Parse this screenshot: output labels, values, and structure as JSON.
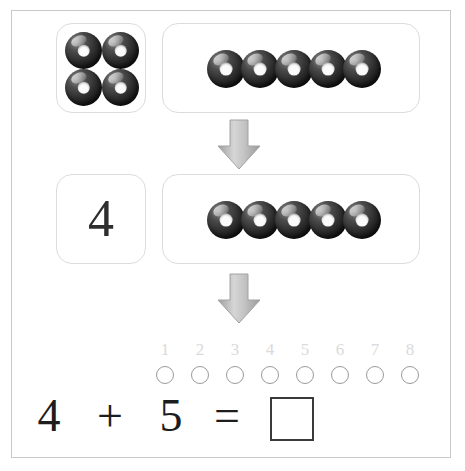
{
  "worksheet": {
    "title": "Addition with beads: 4 + 5",
    "background_color": "#ffffff",
    "frame_border_color": "#c9c9c9"
  },
  "row1": {
    "left_group": {
      "label": "four-beads-group",
      "bead_count": 4,
      "arrangement": "2x2"
    },
    "right_group": {
      "label": "five-beads-group",
      "bead_count": 5,
      "arrangement": "row"
    }
  },
  "arrow1": {
    "direction": "down",
    "color": "#b0b0b0"
  },
  "row2": {
    "left_group": {
      "label": "numeral-card",
      "value": "4"
    },
    "right_group": {
      "label": "five-beads-group",
      "bead_count": 5,
      "arrangement": "row"
    }
  },
  "arrow2": {
    "direction": "down",
    "color": "#b0b0b0"
  },
  "counting_strip": {
    "labels": [
      "1",
      "2",
      "3",
      "4",
      "5",
      "6",
      "7",
      "8"
    ],
    "circle_count": 8,
    "label_color": "#dadada",
    "circle_border_color": "#9a9a9a"
  },
  "equation": {
    "first_addend": "4",
    "operator": "+",
    "second_addend": "5",
    "equals": "=",
    "answer_value": "",
    "answer_placeholder": "answer box"
  },
  "bead_style": {
    "body_color": "#1f1f1f",
    "hole_color": "#fbfbfb",
    "highlight_color": "#8f8f8f"
  }
}
